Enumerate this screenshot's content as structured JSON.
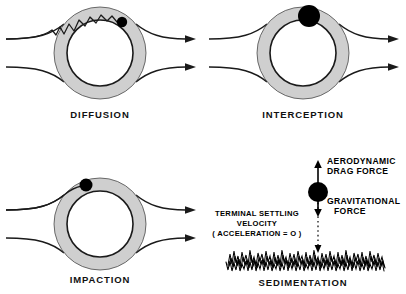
{
  "figure": {
    "background_color": "#ffffff",
    "ink_color": "#111111",
    "ring_fill_color": "#cfcfcf",
    "ring_inner_color": "#ffffff",
    "particle_color": "#000000"
  },
  "panels": [
    {
      "id": "diffusion",
      "caption": "DIFFUSION",
      "mechanism_icon": "brownian-path-icon",
      "particle_count": 1,
      "streamline_count": 2
    },
    {
      "id": "interception",
      "caption": "INTERCEPTION",
      "mechanism_icon": "particle-on-fiber-icon",
      "particle_count": 1,
      "streamline_count": 2
    },
    {
      "id": "impaction",
      "caption": "IMPACTION",
      "mechanism_icon": "straight-trajectory-icon",
      "particle_count": 1,
      "streamline_count": 2
    },
    {
      "id": "sedimentation",
      "caption": "SEDIMENTATION",
      "mechanism_icon": "falling-particle-icon",
      "labels": {
        "drag": "AERODYNAMIC\nDRAG FORCE",
        "drag_line1": "AERODYNAMIC",
        "drag_line2": "DRAG FORCE",
        "gravity_line1": "GRAVITATIONAL",
        "gravity_line2": "FORCE",
        "velocity_line1": "TERMINAL SETTLING",
        "velocity_line2": "VELOCITY",
        "velocity_line3": "( ACCELERATION = O )"
      },
      "arrows": {
        "up_arrow_name": "aerodynamic-drag-arrow",
        "down_arrow_name": "gravitational-force-arrow",
        "fall_path_name": "settling-path-dotted-line"
      },
      "ground_texture": "grass-ground-texture"
    }
  ]
}
